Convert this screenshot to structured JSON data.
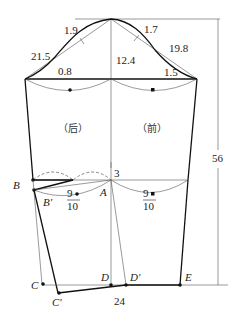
{
  "diagram": {
    "type": "sleeve-pattern",
    "measurements": {
      "top_left_offset": "1.9",
      "top_right_offset": "1.7",
      "left_cap_line": "21.5",
      "right_cap_line": "19.8",
      "cap_height": "12.4",
      "left_curve_offset": "0.8",
      "right_curve_offset": "1.5",
      "elbow_offset": "3",
      "total_length": "56",
      "cuff_width": "24"
    },
    "panels": {
      "back": "（后）",
      "front": "（前）"
    },
    "fractions": {
      "back_num": "9",
      "back_den": "10",
      "front_num": "9",
      "front_den": "10"
    },
    "points": {
      "A": "A",
      "B": "B",
      "B_prime": "B′",
      "C": "C",
      "C_prime": "C′",
      "D": "D",
      "D_prime": "D′",
      "E": "E"
    }
  }
}
